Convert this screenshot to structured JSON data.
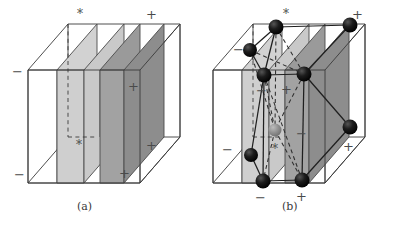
{
  "figure": {
    "background_color": "#ffffff",
    "width": 397,
    "height": 227
  },
  "colors": {
    "line": "#3a3a3a",
    "line_light": "#6a6a6a",
    "face_light": "#d2d2d2",
    "face_mid": "#bcbcbc",
    "face_dark": "#9a9a9a",
    "face_darker": "#8d8d8d",
    "sphere_black": "#111111",
    "sphere_gray": "#8f8f8f",
    "label": "#3a3a3a"
  },
  "panels": [
    {
      "id": "a",
      "caption": "(a)",
      "caption_pos": {
        "x": 77,
        "y": 200
      },
      "description": "Outlined cube containing a light-gray slab plane and a dark-gray slab plane, with dashed hidden edges",
      "signs": [
        {
          "name": "top-star",
          "glyph": "*",
          "x": 77,
          "y": 8,
          "kind": "star"
        },
        {
          "name": "top-right-plus",
          "glyph": "+",
          "x": 146,
          "y": 8,
          "kind": "plus"
        },
        {
          "name": "left-minus",
          "glyph": "−",
          "x": 12,
          "y": 65,
          "kind": "minus"
        },
        {
          "name": "mid-right-plus",
          "glyph": "+",
          "x": 128,
          "y": 80,
          "kind": "plus"
        },
        {
          "name": "interior-star",
          "glyph": "*",
          "x": 76,
          "y": 139,
          "kind": "star"
        },
        {
          "name": "far-right-plus",
          "glyph": "+",
          "x": 146,
          "y": 139,
          "kind": "plus"
        },
        {
          "name": "bottom-minus",
          "glyph": "−",
          "x": 14,
          "y": 168,
          "kind": "minus"
        },
        {
          "name": "bottom-plus",
          "glyph": "+",
          "x": 119,
          "y": 167,
          "kind": "plus"
        }
      ]
    },
    {
      "id": "b",
      "caption": "(b)",
      "caption_pos": {
        "x": 282,
        "y": 200
      },
      "description": "Same cube with atom spheres at slab vertices, one gray interior sphere, and solid plus dashed bond lines",
      "signs": [
        {
          "name": "top-star",
          "glyph": "*",
          "x": 283,
          "y": 8,
          "kind": "star"
        },
        {
          "name": "top-right-plus",
          "glyph": "+",
          "x": 352,
          "y": 8,
          "kind": "plus"
        },
        {
          "name": "left-minus",
          "glyph": "−",
          "x": 233,
          "y": 43,
          "kind": "minus"
        },
        {
          "name": "mid-left-minus",
          "glyph": "−",
          "x": 256,
          "y": 84,
          "kind": "minus"
        },
        {
          "name": "mid-right-plus",
          "glyph": "+",
          "x": 281,
          "y": 83,
          "kind": "plus"
        },
        {
          "name": "interior-minus",
          "glyph": "−",
          "x": 296,
          "y": 127,
          "kind": "minus"
        },
        {
          "name": "left-low-minus",
          "glyph": "−",
          "x": 222,
          "y": 143,
          "kind": "minus"
        },
        {
          "name": "interior-star",
          "glyph": "*",
          "x": 272,
          "y": 143,
          "kind": "star"
        },
        {
          "name": "far-right-plus",
          "glyph": "+",
          "x": 343,
          "y": 140,
          "kind": "plus"
        },
        {
          "name": "bottom-minus",
          "glyph": "−",
          "x": 255,
          "y": 191,
          "kind": "minus"
        },
        {
          "name": "bottom-plus",
          "glyph": "+",
          "x": 296,
          "y": 190,
          "kind": "plus"
        }
      ],
      "spheres": [
        {
          "name": "sphere-top-left-back",
          "x": 276,
          "y": 27,
          "r": 7.5,
          "color": "black"
        },
        {
          "name": "sphere-top-right-back",
          "x": 350,
          "y": 25,
          "r": 7.5,
          "color": "black"
        },
        {
          "name": "sphere-upper-left",
          "x": 250,
          "y": 50,
          "r": 7.0,
          "color": "black"
        },
        {
          "name": "sphere-mid-left",
          "x": 264,
          "y": 75,
          "r": 7.5,
          "color": "black"
        },
        {
          "name": "sphere-mid-right",
          "x": 304,
          "y": 74,
          "r": 7.5,
          "color": "black"
        },
        {
          "name": "sphere-right-front",
          "x": 350,
          "y": 127,
          "r": 7.5,
          "color": "black"
        },
        {
          "name": "sphere-center-gray",
          "x": 275,
          "y": 130,
          "r": 6.5,
          "color": "gray"
        },
        {
          "name": "sphere-lower-left",
          "x": 251,
          "y": 155,
          "r": 7.0,
          "color": "black"
        },
        {
          "name": "sphere-bottom-left",
          "x": 263,
          "y": 181,
          "r": 7.5,
          "color": "black"
        },
        {
          "name": "sphere-bottom-right",
          "x": 302,
          "y": 180,
          "r": 7.5,
          "color": "black"
        }
      ]
    }
  ]
}
